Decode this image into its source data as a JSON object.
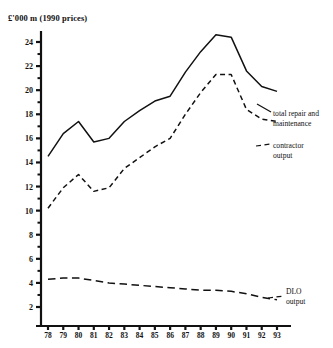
{
  "chart_data": {
    "type": "line",
    "title": "£'000 m  (1990 prices)",
    "xlabel": "",
    "ylabel": "",
    "ylim": [
      0,
      25
    ],
    "xlim": [
      78,
      93
    ],
    "grid": false,
    "legend_position": "inline-right-annotations",
    "ytick_labels": [
      "24",
      "22",
      "20",
      "18",
      "16",
      "14",
      "12",
      "10",
      "8",
      "6",
      "4",
      "2"
    ],
    "ytick_values": [
      24,
      22,
      20,
      18,
      16,
      14,
      12,
      10,
      8,
      6,
      4,
      2
    ],
    "ytick_minor_values": [
      25,
      23,
      21,
      19,
      17,
      15,
      13,
      11,
      9,
      7,
      5,
      3
    ],
    "categories": [
      "78",
      "79",
      "80",
      "81",
      "82",
      "83",
      "84",
      "85",
      "86",
      "87",
      "88",
      "89",
      "90",
      "91",
      "92",
      "93"
    ],
    "x": [
      78,
      79,
      80,
      81,
      82,
      83,
      84,
      85,
      86,
      87,
      88,
      89,
      90,
      91,
      92,
      93
    ],
    "series": [
      {
        "name": "total repair and maintenance",
        "style": "solid",
        "values": [
          14.5,
          16.4,
          17.4,
          15.7,
          16.0,
          17.4,
          18.3,
          19.1,
          19.5,
          21.5,
          23.2,
          24.6,
          24.4,
          21.6,
          20.3,
          19.9
        ]
      },
      {
        "name": "contractor output",
        "style": "short-dash",
        "values": [
          10.2,
          11.9,
          13.0,
          11.6,
          11.9,
          13.5,
          14.4,
          15.3,
          16.0,
          18.0,
          19.8,
          21.3,
          21.3,
          18.4,
          17.6,
          17.4
        ]
      },
      {
        "name": "DLO output",
        "style": "long-dash",
        "values": [
          4.3,
          4.4,
          4.4,
          4.2,
          4.0,
          3.9,
          3.8,
          3.7,
          3.6,
          3.5,
          3.4,
          3.4,
          3.3,
          3.1,
          2.8,
          2.6
        ]
      }
    ],
    "annotations": [
      {
        "id": "total",
        "line1": "total repair and",
        "line2": "maintenance"
      },
      {
        "id": "contractor",
        "line1": "contractor",
        "line2": "output"
      },
      {
        "id": "dlo",
        "line1": "DLO",
        "line2": "output"
      }
    ],
    "colors": {
      "ink": "#111111",
      "background": "#ffffff"
    }
  }
}
